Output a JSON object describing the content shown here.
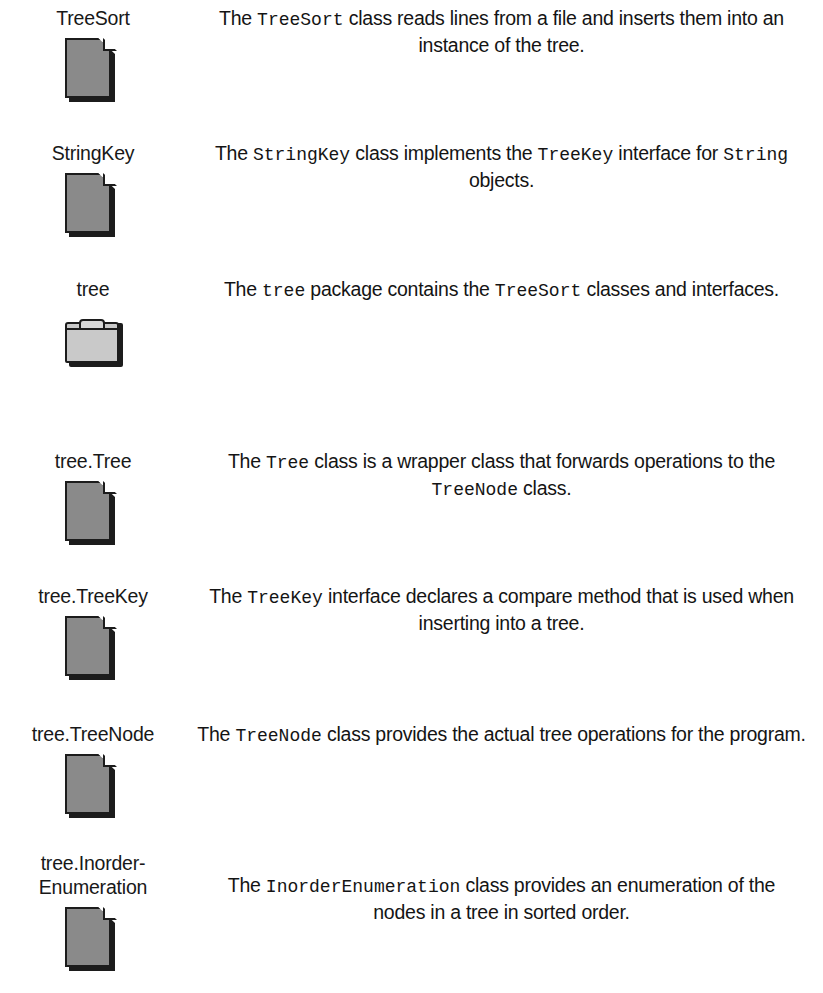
{
  "page": {
    "width": 823,
    "height": 993,
    "background": "#ffffff",
    "text_color": "#141414",
    "icon_fill": "#8a8a8a",
    "folder_fill": "#c9c9c9",
    "icon_outline": "#1c1c1c"
  },
  "rows": [
    {
      "label": "TreeSort",
      "icon": "file-icon",
      "top": 6,
      "description_parts": [
        {
          "type": "text",
          "value": "The "
        },
        {
          "type": "code",
          "value": "TreeSort"
        },
        {
          "type": "text",
          "value": " class reads lines from a file and inserts them into an instance of the tree."
        }
      ],
      "description_plain": "The TreeSort class reads lines from a file and inserts them into an instance of the tree."
    },
    {
      "label": "StringKey",
      "icon": "file-icon",
      "top": 141,
      "description_parts": [
        {
          "type": "text",
          "value": "The "
        },
        {
          "type": "code",
          "value": "StringKey"
        },
        {
          "type": "text",
          "value": " class implements the "
        },
        {
          "type": "code",
          "value": "TreeKey"
        },
        {
          "type": "text",
          "value": " interface for "
        },
        {
          "type": "code",
          "value": "String"
        },
        {
          "type": "text",
          "value": " objects."
        }
      ],
      "description_plain": "The StringKey class implements the TreeKey interface for String objects."
    },
    {
      "label": "tree",
      "icon": "folder-icon",
      "top": 277,
      "description_parts": [
        {
          "type": "text",
          "value": "The "
        },
        {
          "type": "code",
          "value": "tree"
        },
        {
          "type": "text",
          "value": " package contains the "
        },
        {
          "type": "code",
          "value": "TreeSort"
        },
        {
          "type": "text",
          "value": " classes and interfaces."
        }
      ],
      "description_plain": "The tree package contains the TreeSort classes and interfaces."
    },
    {
      "label": "tree.Tree",
      "icon": "file-icon",
      "top": 449,
      "description_parts": [
        {
          "type": "text",
          "value": "The "
        },
        {
          "type": "code",
          "value": "Tree"
        },
        {
          "type": "text",
          "value": " class is a wrapper class that forwards operations to the "
        },
        {
          "type": "code",
          "value": "TreeNode"
        },
        {
          "type": "text",
          "value": " class."
        }
      ],
      "description_plain": "The Tree class is a wrapper class that forwards operations to the TreeNode class."
    },
    {
      "label": "tree.TreeKey",
      "icon": "file-icon",
      "top": 584,
      "description_parts": [
        {
          "type": "text",
          "value": "The "
        },
        {
          "type": "code",
          "value": "TreeKey"
        },
        {
          "type": "text",
          "value": " interface declares a compare method that is used when inserting into a tree."
        }
      ],
      "description_plain": "The TreeKey interface declares a compare method that is used when inserting into a tree."
    },
    {
      "label": "tree.TreeNode",
      "icon": "file-icon",
      "top": 722,
      "description_parts": [
        {
          "type": "text",
          "value": "The "
        },
        {
          "type": "code",
          "value": "TreeNode"
        },
        {
          "type": "text",
          "value": " class provides the actual tree operations for the program."
        }
      ],
      "description_plain": "The TreeNode class provides the actual tree operations for the program."
    },
    {
      "label": "tree.Inorder-\nEnumeration",
      "icon": "file-icon",
      "top": 851,
      "description_top_offset": 22,
      "description_parts": [
        {
          "type": "text",
          "value": "The "
        },
        {
          "type": "code",
          "value": "InorderEnumeration"
        },
        {
          "type": "text",
          "value": " class provides an enumeration of the nodes in a tree in sorted order."
        }
      ],
      "description_plain": "The InorderEnumeration class provides an enumeration of the nodes in a tree in sorted order."
    }
  ]
}
